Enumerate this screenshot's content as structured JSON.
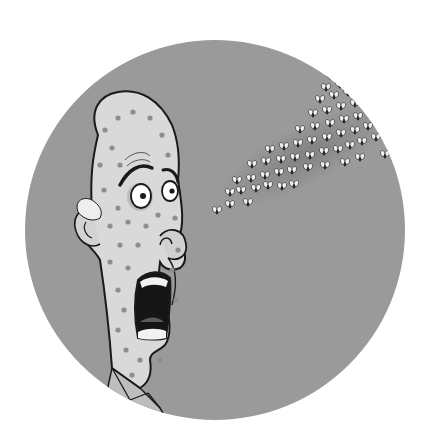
{
  "illustration": {
    "description": "Cartoon of a bald man covered in spots, screaming with mouth wide open in fear at a swarm of flies approaching from the upper right",
    "style": "grayscale cartoon inside a circular medallion",
    "colors": {
      "page_background": "#ffffff",
      "circle_fill": "#9a9a9a",
      "skin": "#d9d9d9",
      "spots": "#8e8e8e",
      "outline": "#1a1a1a",
      "mouth": "#151515",
      "teeth": "#f2f2f2",
      "hair": "#eeeeee",
      "fly_body": "#2a2a2a",
      "fly_wing": "#f0f0f0",
      "swarm_shadow": "#6e6e6e"
    },
    "circle": {
      "cx": 215,
      "cy": 230,
      "r": 190
    },
    "subjects": [
      {
        "name": "man",
        "expression": "terrified, screaming",
        "features": [
          "bald head",
          "spotted skin",
          "tuft of white hair by ear",
          "wide eyes",
          "raised eyebrows",
          "collared shirt"
        ]
      },
      {
        "name": "fly-swarm",
        "count_approx": 60,
        "direction": "from upper right toward man's face"
      }
    ]
  }
}
